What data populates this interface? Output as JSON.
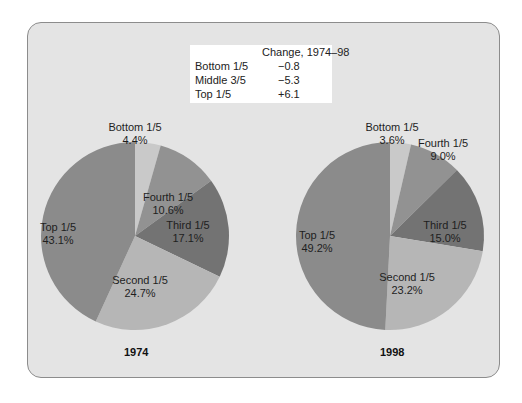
{
  "legend": {
    "header": "Change, 1974–98",
    "rows": [
      {
        "label": "Bottom 1/5",
        "value": "−0.8"
      },
      {
        "label": "Middle 3/5",
        "value": "−5.3"
      },
      {
        "label": "Top 1/5",
        "value": "+6.1"
      }
    ]
  },
  "colors": {
    "panel_bg": "#e4e4e4",
    "bottom": "#c9c9c9",
    "fourth": "#929292",
    "third": "#737373",
    "second": "#b6b6b6",
    "top": "#8b8b8b"
  },
  "chart_data": [
    {
      "type": "pie",
      "title": "1974",
      "categories": [
        "Bottom 1/5",
        "Fourth 1/5",
        "Third 1/5",
        "Second 1/5",
        "Top 1/5"
      ],
      "values": [
        4.4,
        10.6,
        17.1,
        24.7,
        43.1
      ],
      "labels": [
        "4.4%",
        "10.6%",
        "17.1%",
        "24.7%",
        "43.1%"
      ]
    },
    {
      "type": "pie",
      "title": "1998",
      "categories": [
        "Bottom 1/5",
        "Fourth 1/5",
        "Third 1/5",
        "Second 1/5",
        "Top 1/5"
      ],
      "values": [
        3.6,
        9.0,
        15.0,
        23.2,
        49.2
      ],
      "labels": [
        "3.6%",
        "9.0%",
        "15.0%",
        "23.2%",
        "49.2%"
      ]
    },
    {
      "type": "table",
      "title": "Change, 1974–98",
      "categories": [
        "Bottom 1/5",
        "Middle 3/5",
        "Top 1/5"
      ],
      "values": [
        -0.8,
        -5.3,
        6.1
      ]
    }
  ]
}
